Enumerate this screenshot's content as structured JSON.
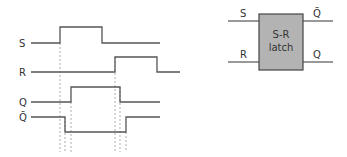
{
  "timing_diagram": {
    "signals": [
      {
        "name": "S",
        "label": "S",
        "y_low": 43,
        "y_high": 27
      },
      {
        "name": "R",
        "label": "R",
        "y_low": 72,
        "y_high": 57
      },
      {
        "name": "Q",
        "label": "Q",
        "y_low": 102,
        "y_high": 87
      },
      {
        "name": "Qbar",
        "label": "Q̄",
        "y_low": 132,
        "y_high": 117
      }
    ],
    "colors": {
      "line": "#555555",
      "dash": "#999999"
    }
  },
  "latch": {
    "title_line1": "S-R",
    "title_line2": "latch",
    "input_top": "S",
    "input_bottom": "R",
    "output_top": "Q̄",
    "output_bottom": "Q",
    "fill": "#b3b3b3"
  }
}
